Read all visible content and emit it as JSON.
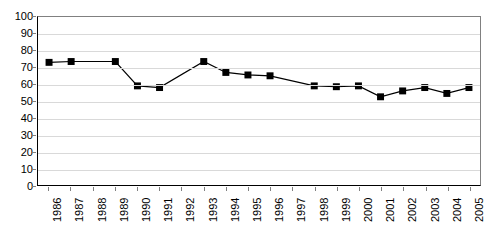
{
  "chart_data": {
    "type": "line",
    "title": "",
    "subtitle": "",
    "xlabel": "",
    "ylabel": "",
    "legend": [],
    "legend_position": "none",
    "grid": true,
    "xlim": [
      "1986",
      "2005"
    ],
    "ylim": [
      0,
      100
    ],
    "y_ticks": [
      0,
      10,
      20,
      30,
      40,
      50,
      60,
      70,
      80,
      90,
      100
    ],
    "y_tick_labels": [
      "0",
      "10",
      "20",
      "30",
      "40",
      "50",
      "60",
      "70",
      "80",
      "90",
      "100"
    ],
    "categories": [
      "1986",
      "1987",
      "1988",
      "1989",
      "1990",
      "1991",
      "1992",
      "1993",
      "1994",
      "1995",
      "1996",
      "1997",
      "1998",
      "1999",
      "2000",
      "2001",
      "2002",
      "2003",
      "2004",
      "2005"
    ],
    "values": [
      73,
      73.5,
      null,
      73.5,
      59,
      58,
      null,
      73.5,
      67,
      65.5,
      65,
      null,
      59,
      58.5,
      59,
      52.5,
      56,
      58,
      54.5,
      58
    ],
    "marker": "square",
    "marker_color": "#000000",
    "line_color": "#000000",
    "series": [
      {
        "name": "",
        "values": [
          73,
          73.5,
          null,
          73.5,
          59,
          58,
          null,
          73.5,
          67,
          65.5,
          65,
          null,
          59,
          58.5,
          59,
          52.5,
          56,
          58,
          54.5,
          58
        ]
      }
    ]
  },
  "colors": {
    "line": "#000000",
    "marker": "#000000",
    "grid": "#d9d9d9",
    "axis": "#000000",
    "frame": "#808080",
    "background": "#ffffff",
    "text": "#000000"
  }
}
